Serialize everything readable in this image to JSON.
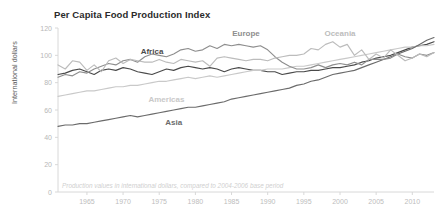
{
  "chart_data": {
    "type": "line",
    "title": "Per Capita Food Production Index",
    "xlabel": "",
    "ylabel": "International dollars",
    "footnote": "Production values in international dollars, compared to 2004-2006 base period",
    "xlim": [
      1961,
      2013
    ],
    "ylim": [
      0,
      120
    ],
    "y_ticks": [
      0,
      20,
      40,
      60,
      80,
      100,
      120
    ],
    "x_ticks": [
      1965,
      1970,
      1975,
      1980,
      1985,
      1990,
      1995,
      2000,
      2005,
      2010
    ],
    "grid": false,
    "legend": "inline-labels",
    "x": [
      1961,
      1962,
      1963,
      1964,
      1965,
      1966,
      1967,
      1968,
      1969,
      1970,
      1971,
      1972,
      1973,
      1974,
      1975,
      1976,
      1977,
      1978,
      1979,
      1980,
      1981,
      1982,
      1983,
      1984,
      1985,
      1986,
      1987,
      1988,
      1989,
      1990,
      1991,
      1992,
      1993,
      1994,
      1995,
      1996,
      1997,
      1998,
      1999,
      2000,
      2001,
      2002,
      2003,
      2004,
      2005,
      2006,
      2007,
      2008,
      2009,
      2010,
      2011,
      2012,
      2013
    ],
    "series": [
      {
        "name": "Africa",
        "color": "#4a4a4a",
        "label_x": 1974,
        "label_y": 101,
        "values": [
          86,
          87,
          89,
          90,
          88,
          86,
          89,
          90,
          89,
          91,
          90,
          88,
          87,
          86,
          88,
          90,
          89,
          91,
          92,
          91,
          90,
          91,
          90,
          88,
          90,
          91,
          90,
          89,
          89,
          88,
          88,
          86,
          87,
          88,
          88,
          89,
          89,
          90,
          91,
          91,
          92,
          93,
          95,
          96,
          98,
          99,
          100,
          102,
          104,
          106,
          107,
          108,
          110
        ]
      },
      {
        "name": "Americas",
        "color": "#c9c9c9",
        "label_x": 1976,
        "label_y": 66,
        "values": [
          70,
          71,
          72,
          73,
          74,
          74,
          75,
          76,
          77,
          77,
          78,
          78,
          79,
          80,
          81,
          81,
          82,
          83,
          84,
          83,
          84,
          85,
          84,
          85,
          86,
          87,
          88,
          89,
          89,
          90,
          90,
          90,
          91,
          92,
          92,
          93,
          94,
          95,
          96,
          97,
          98,
          99,
          100,
          101,
          102,
          103,
          104,
          105,
          106,
          106,
          107,
          107,
          108
        ]
      },
      {
        "name": "Asia",
        "color": "#6b6b6b",
        "label_x": 1977,
        "label_y": 49,
        "values": [
          48,
          49,
          49,
          50,
          50,
          51,
          52,
          53,
          54,
          55,
          56,
          55,
          56,
          57,
          58,
          59,
          60,
          61,
          62,
          62,
          63,
          64,
          65,
          66,
          68,
          69,
          70,
          71,
          72,
          73,
          74,
          75,
          76,
          78,
          79,
          81,
          82,
          84,
          86,
          87,
          88,
          89,
          91,
          93,
          95,
          97,
          99,
          101,
          103,
          105,
          108,
          111,
          113
        ]
      },
      {
        "name": "Europe",
        "color": "#8e8e8e",
        "label_x": 1987,
        "label_y": 114,
        "values": [
          84,
          86,
          85,
          88,
          87,
          90,
          92,
          94,
          93,
          96,
          97,
          95,
          99,
          101,
          100,
          99,
          101,
          104,
          105,
          103,
          104,
          107,
          105,
          108,
          107,
          108,
          107,
          106,
          107,
          104,
          99,
          95,
          92,
          90,
          90,
          91,
          93,
          91,
          93,
          94,
          93,
          95,
          93,
          97,
          97,
          97,
          98,
          101,
          99,
          98,
          101,
          100,
          102
        ]
      },
      {
        "name": "Oceania",
        "color": "#bcbcbc",
        "label_x": 2000,
        "label_y": 114,
        "values": [
          93,
          90,
          96,
          95,
          89,
          93,
          88,
          96,
          98,
          94,
          97,
          96,
          95,
          95,
          97,
          95,
          94,
          97,
          96,
          95,
          96,
          92,
          98,
          99,
          98,
          97,
          96,
          97,
          97,
          96,
          98,
          99,
          100,
          100,
          101,
          105,
          104,
          108,
          110,
          106,
          108,
          100,
          104,
          97,
          101,
          98,
          104,
          100,
          96,
          98,
          101,
          99,
          102
        ]
      }
    ]
  }
}
